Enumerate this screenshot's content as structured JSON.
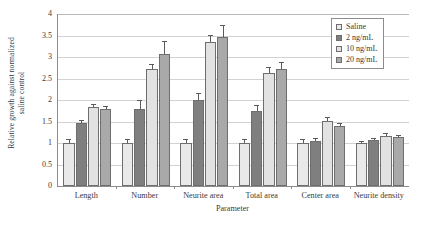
{
  "chart_data": {
    "type": "bar",
    "title": "",
    "xlabel": "Parameter",
    "ylabel_line1": "Relative growth against normalized",
    "ylabel_line2": "saline control",
    "ylim": [
      0,
      4
    ],
    "yticks": [
      "4",
      "3.5",
      "3",
      "2.5",
      "2",
      "1.5",
      "1",
      "0.5",
      "0"
    ],
    "ytick_values": [
      4,
      3.5,
      3,
      2.5,
      2,
      1.5,
      1,
      0.5,
      0
    ],
    "grid": true,
    "legend_position": "top-right",
    "categories": [
      "Length",
      "Number",
      "Neurite area",
      "Total area",
      "Center area",
      "Neurite density"
    ],
    "series": [
      {
        "name": "Saline",
        "color": "#e9e9e9",
        "values": [
          1.0,
          1.0,
          1.0,
          1.0,
          1.0,
          1.0
        ],
        "errors": [
          0.07,
          0.08,
          0.06,
          0.06,
          0.06,
          0.02
        ]
      },
      {
        "name": "2 ng/mL",
        "color": "#7f7f7f",
        "values": [
          1.47,
          1.79,
          2.0,
          1.75,
          1.05,
          1.07
        ],
        "errors": [
          0.05,
          0.18,
          0.13,
          0.12,
          0.05,
          0.02
        ]
      },
      {
        "name": "10 ng/mL",
        "color": "#e2e2e2",
        "values": [
          1.84,
          2.72,
          3.36,
          2.63,
          1.51,
          1.17
        ],
        "errors": [
          0.05,
          0.1,
          0.12,
          0.11,
          0.08,
          0.04
        ]
      },
      {
        "name": "20 ng/mL",
        "color": "#a9a9a9",
        "values": [
          1.79,
          3.08,
          3.46,
          2.73,
          1.4,
          1.15
        ],
        "errors": [
          0.04,
          0.28,
          0.26,
          0.12,
          0.05,
          0.02
        ]
      }
    ]
  }
}
